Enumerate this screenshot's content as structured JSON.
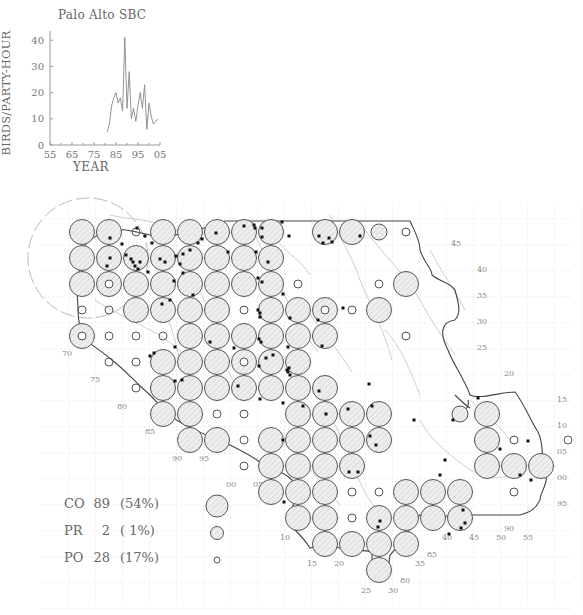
{
  "chart_data": {
    "type": "line",
    "title": "Palo Alto SBC",
    "xlabel": "YEAR",
    "ylabel": "BIRDS/PARTY-HOUR",
    "x_ticks": [
      "55",
      "65",
      "75",
      "85",
      "95",
      "05"
    ],
    "y_ticks": [
      "0",
      "10",
      "20",
      "30",
      "40"
    ],
    "xlim": [
      1955,
      2005
    ],
    "ylim": [
      0,
      42
    ],
    "x": [
      1981,
      1982,
      1983,
      1984,
      1985,
      1986,
      1987,
      1988,
      1989,
      1990,
      1991,
      1992,
      1993,
      1994,
      1995,
      1996,
      1997,
      1998,
      1999,
      2000,
      2001,
      2002,
      2003,
      2004
    ],
    "values": [
      5,
      8,
      15,
      18,
      20,
      16,
      18,
      13,
      41,
      14,
      28,
      10,
      14,
      9,
      15,
      20,
      14,
      23,
      6,
      16,
      11,
      8,
      9,
      10
    ],
    "grid": false
  },
  "map": {
    "grid_origin_x": 82,
    "grid_origin_y": 232,
    "cell_dx": 27,
    "cell_dy": 26,
    "left_labels": [
      {
        "text": "70",
        "x": 62,
        "y": 356
      },
      {
        "text": "75",
        "x": 90,
        "y": 382
      },
      {
        "text": "80",
        "x": 117,
        "y": 409
      },
      {
        "text": "85",
        "x": 145,
        "y": 434
      },
      {
        "text": "90",
        "x": 172,
        "y": 461
      },
      {
        "text": "95",
        "x": 199,
        "y": 461
      },
      {
        "text": "00",
        "x": 226,
        "y": 487
      },
      {
        "text": "05",
        "x": 253,
        "y": 487
      },
      {
        "text": "10",
        "x": 280,
        "y": 540
      },
      {
        "text": "15",
        "x": 307,
        "y": 566
      },
      {
        "text": "20",
        "x": 334,
        "y": 566
      },
      {
        "text": "25",
        "x": 361,
        "y": 593
      },
      {
        "text": "30",
        "x": 388,
        "y": 593
      },
      {
        "text": "80",
        "x": 400,
        "y": 583
      },
      {
        "text": "35",
        "x": 415,
        "y": 566
      },
      {
        "text": "85",
        "x": 427,
        "y": 557
      },
      {
        "text": "40",
        "x": 442,
        "y": 540
      },
      {
        "text": "45",
        "x": 469,
        "y": 540
      },
      {
        "text": "50",
        "x": 496,
        "y": 540
      },
      {
        "text": "90",
        "x": 504,
        "y": 531
      },
      {
        "text": "55",
        "x": 523,
        "y": 540
      }
    ],
    "right_labels": [
      {
        "text": "45",
        "x": 451,
        "y": 246
      },
      {
        "text": "40",
        "x": 477,
        "y": 272
      },
      {
        "text": "35",
        "x": 477,
        "y": 298
      },
      {
        "text": "30",
        "x": 477,
        "y": 324
      },
      {
        "text": "25",
        "x": 477,
        "y": 350
      },
      {
        "text": "20",
        "x": 504,
        "y": 376
      },
      {
        "text": "15",
        "x": 557,
        "y": 402
      },
      {
        "text": "10",
        "x": 557,
        "y": 428
      },
      {
        "text": "05",
        "x": 557,
        "y": 454
      },
      {
        "text": "00",
        "x": 557,
        "y": 480
      },
      {
        "text": "95",
        "x": 557,
        "y": 506
      }
    ],
    "circles": [
      {
        "c": 0,
        "r": 0,
        "s": "CO"
      },
      {
        "c": 1,
        "r": 0,
        "s": "CO"
      },
      {
        "c": 2,
        "r": 0,
        "s": "PO"
      },
      {
        "c": 3,
        "r": 0,
        "s": "CO"
      },
      {
        "c": 4,
        "r": 0,
        "s": "CO"
      },
      {
        "c": 5,
        "r": 0,
        "s": "CO"
      },
      {
        "c": 6,
        "r": 0,
        "s": "CO"
      },
      {
        "c": 7,
        "r": 0,
        "s": "CO"
      },
      {
        "c": 9,
        "r": 0,
        "s": "CO"
      },
      {
        "c": 10,
        "r": 0,
        "s": "CO"
      },
      {
        "c": 11,
        "r": 0,
        "s": "PR"
      },
      {
        "c": 12,
        "r": 0,
        "s": "PO"
      },
      {
        "c": 0,
        "r": 1,
        "s": "CO"
      },
      {
        "c": 1,
        "r": 1,
        "s": "CO"
      },
      {
        "c": 2,
        "r": 1,
        "s": "CO"
      },
      {
        "c": 3,
        "r": 1,
        "s": "CO"
      },
      {
        "c": 4,
        "r": 1,
        "s": "CO"
      },
      {
        "c": 5,
        "r": 1,
        "s": "CO"
      },
      {
        "c": 6,
        "r": 1,
        "s": "CO"
      },
      {
        "c": 7,
        "r": 1,
        "s": "CO"
      },
      {
        "c": 0,
        "r": 2,
        "s": "CO"
      },
      {
        "c": 1,
        "r": 2,
        "s": "CO",
        "inner": true
      },
      {
        "c": 2,
        "r": 2,
        "s": "CO"
      },
      {
        "c": 3,
        "r": 2,
        "s": "CO"
      },
      {
        "c": 4,
        "r": 2,
        "s": "CO"
      },
      {
        "c": 5,
        "r": 2,
        "s": "CO"
      },
      {
        "c": 6,
        "r": 2,
        "s": "CO"
      },
      {
        "c": 7,
        "r": 2,
        "s": "CO"
      },
      {
        "c": 8,
        "r": 2,
        "s": "PO"
      },
      {
        "c": 11,
        "r": 2,
        "s": "PO"
      },
      {
        "c": 12,
        "r": 2,
        "s": "CO"
      },
      {
        "c": 0,
        "r": 3,
        "s": "PO"
      },
      {
        "c": 1,
        "r": 3,
        "s": "PO"
      },
      {
        "c": 2,
        "r": 3,
        "s": "CO"
      },
      {
        "c": 3,
        "r": 3,
        "s": "CO"
      },
      {
        "c": 4,
        "r": 3,
        "s": "CO"
      },
      {
        "c": 5,
        "r": 3,
        "s": "CO"
      },
      {
        "c": 6,
        "r": 3,
        "s": "PO"
      },
      {
        "c": 7,
        "r": 3,
        "s": "CO"
      },
      {
        "c": 8,
        "r": 3,
        "s": "CO"
      },
      {
        "c": 9,
        "r": 3,
        "s": "CO",
        "inner": true
      },
      {
        "c": 10,
        "r": 3,
        "s": "PO"
      },
      {
        "c": 11,
        "r": 3,
        "s": "CO"
      },
      {
        "c": 0,
        "r": 4,
        "s": "CO",
        "inner": true
      },
      {
        "c": 1,
        "r": 4,
        "s": "PO"
      },
      {
        "c": 2,
        "r": 4,
        "s": "PO"
      },
      {
        "c": 3,
        "r": 4,
        "s": "PO"
      },
      {
        "c": 4,
        "r": 4,
        "s": "CO"
      },
      {
        "c": 5,
        "r": 4,
        "s": "CO"
      },
      {
        "c": 6,
        "r": 4,
        "s": "CO"
      },
      {
        "c": 7,
        "r": 4,
        "s": "CO"
      },
      {
        "c": 8,
        "r": 4,
        "s": "CO"
      },
      {
        "c": 9,
        "r": 4,
        "s": "CO"
      },
      {
        "c": 12,
        "r": 4,
        "s": "PO"
      },
      {
        "c": 1,
        "r": 5,
        "s": "PO"
      },
      {
        "c": 2,
        "r": 5,
        "s": "PO"
      },
      {
        "c": 3,
        "r": 5,
        "s": "CO"
      },
      {
        "c": 4,
        "r": 5,
        "s": "CO"
      },
      {
        "c": 5,
        "r": 5,
        "s": "CO"
      },
      {
        "c": 6,
        "r": 5,
        "s": "CO",
        "inner": true
      },
      {
        "c": 7,
        "r": 5,
        "s": "CO"
      },
      {
        "c": 8,
        "r": 5,
        "s": "CO"
      },
      {
        "c": 2,
        "r": 6,
        "s": "PO"
      },
      {
        "c": 3,
        "r": 6,
        "s": "CO"
      },
      {
        "c": 4,
        "r": 6,
        "s": "CO"
      },
      {
        "c": 5,
        "r": 6,
        "s": "CO"
      },
      {
        "c": 6,
        "r": 6,
        "s": "CO"
      },
      {
        "c": 7,
        "r": 6,
        "s": "CO"
      },
      {
        "c": 8,
        "r": 6,
        "s": "CO"
      },
      {
        "c": 9,
        "r": 6,
        "s": "CO"
      },
      {
        "c": 3,
        "r": 7,
        "s": "CO"
      },
      {
        "c": 4,
        "r": 7,
        "s": "CO"
      },
      {
        "c": 5,
        "r": 7,
        "s": "PO"
      },
      {
        "c": 6,
        "r": 7,
        "s": "PO"
      },
      {
        "c": 8,
        "r": 7,
        "s": "CO"
      },
      {
        "c": 9,
        "r": 7,
        "s": "CO"
      },
      {
        "c": 10,
        "r": 7,
        "s": "CO"
      },
      {
        "c": 11,
        "r": 7,
        "s": "CO"
      },
      {
        "c": 14,
        "r": 7,
        "s": "PR"
      },
      {
        "c": 15,
        "r": 7,
        "s": "CO"
      },
      {
        "c": 4,
        "r": 8,
        "s": "CO"
      },
      {
        "c": 5,
        "r": 8,
        "s": "CO"
      },
      {
        "c": 6,
        "r": 8,
        "s": "PO"
      },
      {
        "c": 7,
        "r": 8,
        "s": "CO"
      },
      {
        "c": 8,
        "r": 8,
        "s": "CO"
      },
      {
        "c": 9,
        "r": 8,
        "s": "CO"
      },
      {
        "c": 10,
        "r": 8,
        "s": "CO"
      },
      {
        "c": 11,
        "r": 8,
        "s": "CO"
      },
      {
        "c": 15,
        "r": 8,
        "s": "CO"
      },
      {
        "c": 16,
        "r": 8,
        "s": "PO"
      },
      {
        "c": 18,
        "r": 8,
        "s": "PO"
      },
      {
        "c": 6,
        "r": 9,
        "s": "PO"
      },
      {
        "c": 7,
        "r": 9,
        "s": "CO"
      },
      {
        "c": 8,
        "r": 9,
        "s": "CO"
      },
      {
        "c": 9,
        "r": 9,
        "s": "CO"
      },
      {
        "c": 10,
        "r": 9,
        "s": "CO"
      },
      {
        "c": 15,
        "r": 9,
        "s": "CO"
      },
      {
        "c": 16,
        "r": 9,
        "s": "CO"
      },
      {
        "c": 17,
        "r": 9,
        "s": "CO"
      },
      {
        "c": 7,
        "r": 10,
        "s": "CO"
      },
      {
        "c": 8,
        "r": 10,
        "s": "CO"
      },
      {
        "c": 9,
        "r": 10,
        "s": "CO"
      },
      {
        "c": 10,
        "r": 10,
        "s": "PO"
      },
      {
        "c": 11,
        "r": 10,
        "s": "PO"
      },
      {
        "c": 12,
        "r": 10,
        "s": "CO"
      },
      {
        "c": 13,
        "r": 10,
        "s": "CO"
      },
      {
        "c": 14,
        "r": 10,
        "s": "CO"
      },
      {
        "c": 16,
        "r": 10,
        "s": "PO"
      },
      {
        "c": 8,
        "r": 11,
        "s": "CO"
      },
      {
        "c": 9,
        "r": 11,
        "s": "CO"
      },
      {
        "c": 10,
        "r": 11,
        "s": "PO"
      },
      {
        "c": 11,
        "r": 11,
        "s": "CO"
      },
      {
        "c": 12,
        "r": 11,
        "s": "CO"
      },
      {
        "c": 13,
        "r": 11,
        "s": "CO"
      },
      {
        "c": 14,
        "r": 11,
        "s": "CO"
      },
      {
        "c": 9,
        "r": 12,
        "s": "CO"
      },
      {
        "c": 10,
        "r": 12,
        "s": "CO"
      },
      {
        "c": 11,
        "r": 12,
        "s": "CO"
      },
      {
        "c": 12,
        "r": 12,
        "s": "CO"
      },
      {
        "c": 11,
        "r": 13,
        "s": "CO"
      }
    ],
    "dots": [
      [
        110,
        238
      ],
      [
        137,
        228
      ],
      [
        145,
        236
      ],
      [
        152,
        243
      ],
      [
        122,
        244
      ],
      [
        107,
        266
      ],
      [
        110,
        258
      ],
      [
        126,
        255
      ],
      [
        131,
        259
      ],
      [
        133,
        262
      ],
      [
        135,
        266
      ],
      [
        140,
        262
      ],
      [
        138,
        269
      ],
      [
        148,
        272
      ],
      [
        160,
        259
      ],
      [
        165,
        262
      ],
      [
        176,
        256
      ],
      [
        180,
        264
      ],
      [
        183,
        254
      ],
      [
        190,
        250
      ],
      [
        198,
        243
      ],
      [
        202,
        239
      ],
      [
        216,
        233
      ],
      [
        228,
        252
      ],
      [
        244,
        226
      ],
      [
        254,
        225
      ],
      [
        255,
        228
      ],
      [
        262,
        228
      ],
      [
        262,
        237
      ],
      [
        289,
        236
      ],
      [
        282,
        222
      ],
      [
        319,
        236
      ],
      [
        323,
        243
      ],
      [
        329,
        238
      ],
      [
        332,
        242
      ],
      [
        360,
        236
      ],
      [
        256,
        252
      ],
      [
        268,
        262
      ],
      [
        258,
        278
      ],
      [
        262,
        282
      ],
      [
        283,
        294
      ],
      [
        258,
        310
      ],
      [
        260,
        313
      ],
      [
        260,
        317
      ],
      [
        290,
        318
      ],
      [
        318,
        320
      ],
      [
        343,
        308
      ],
      [
        259,
        339
      ],
      [
        261,
        342
      ],
      [
        288,
        347
      ],
      [
        322,
        346
      ],
      [
        174,
        281
      ],
      [
        183,
        273
      ],
      [
        193,
        295
      ],
      [
        170,
        300
      ],
      [
        162,
        304
      ],
      [
        150,
        356
      ],
      [
        154,
        353
      ],
      [
        175,
        347
      ],
      [
        210,
        342
      ],
      [
        234,
        348
      ],
      [
        266,
        358
      ],
      [
        259,
        366
      ],
      [
        273,
        355
      ],
      [
        287,
        370
      ],
      [
        288,
        372
      ],
      [
        290,
        375
      ],
      [
        289,
        368
      ],
      [
        175,
        381
      ],
      [
        182,
        380
      ],
      [
        238,
        386
      ],
      [
        260,
        399
      ],
      [
        283,
        403
      ],
      [
        303,
        406
      ],
      [
        319,
        391
      ],
      [
        372,
        406
      ],
      [
        348,
        409
      ],
      [
        369,
        384
      ],
      [
        414,
        420
      ],
      [
        326,
        414
      ],
      [
        453,
        420
      ],
      [
        283,
        440
      ],
      [
        370,
        436
      ],
      [
        376,
        445
      ],
      [
        358,
        472
      ],
      [
        349,
        472
      ],
      [
        284,
        502
      ],
      [
        478,
        398
      ],
      [
        528,
        441
      ],
      [
        500,
        449
      ],
      [
        445,
        460
      ],
      [
        440,
        475
      ],
      [
        531,
        480
      ],
      [
        520,
        475
      ],
      [
        380,
        521
      ],
      [
        378,
        527
      ],
      [
        465,
        523
      ],
      [
        463,
        510
      ],
      [
        461,
        528
      ],
      [
        449,
        534
      ]
    ]
  },
  "legend": {
    "rows": [
      {
        "code": "CO",
        "count": "89",
        "pct": "(54%)",
        "size": "large"
      },
      {
        "code": "PR",
        "count": "2",
        "pct": "( 1%)",
        "size": "medium"
      },
      {
        "code": "PO",
        "count": "28",
        "pct": "(17%)",
        "size": "small"
      }
    ]
  },
  "colors": {
    "circle_stroke": "#555555",
    "circle_fill": "#ececec",
    "hatch": "#cccccc",
    "border": "#444444",
    "river": "#cfcfcf",
    "grid": "#e2e2e2",
    "dot": "#111111",
    "text": "#666666"
  }
}
